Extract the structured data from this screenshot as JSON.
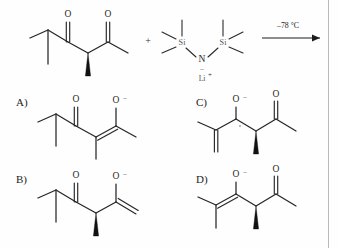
{
  "scheme": {
    "title_present": false,
    "reaction": {
      "reactant_name": "2-methyl-1-(propan-2-yl)-pentane-1,3-dione (chiral alpha-methyl diketone)",
      "plus_symbol": "+",
      "reagent_name": "LiHMDS",
      "reagent_atoms": {
        "silicon_left": "Si",
        "nitrogen": "N",
        "silicon_right": "Si",
        "nitrogen_charge": "–",
        "counterion": "Li",
        "counterion_charge": "+"
      },
      "conditions": "–78 °C",
      "arrow": "reaction-arrow-right"
    },
    "oxygen_label": "O",
    "enolate_oxygen_label": "O",
    "enolate_charge": "–"
  },
  "options": [
    {
      "id": "A",
      "label": "A)",
      "description": "thermodynamic enolate toward methyl ketone side, tetrasubstituted alkene, O-minus on right",
      "oxygens": [
        "O",
        "O"
      ],
      "charge": "–"
    },
    {
      "id": "B",
      "label": "B)",
      "description": "kinetic terminal enolate on right, exocyclic =CH2, wedge methyl retained",
      "oxygens": [
        "O",
        "O"
      ],
      "charge": "–"
    },
    {
      "id": "C",
      "label": "C)",
      "description": "enolate toward isopropyl side with exocyclic alkene, ketone on right, wedge methyl",
      "oxygens": [
        "O",
        "O"
      ],
      "charge": "–"
    },
    {
      "id": "D",
      "label": "D)",
      "description": "tetrasubstituted enolate toward isopropyl side, ketone on right, wedge methyl",
      "oxygens": [
        "O",
        "O"
      ],
      "charge": "–"
    }
  ],
  "colors": {
    "ink": "#262626",
    "label_gray": "#555555",
    "border": "#b9b9b9",
    "background": "#fefefe"
  }
}
